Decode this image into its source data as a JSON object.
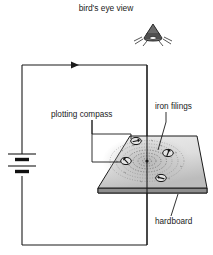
{
  "diagram": {
    "title_label": "bird's eye view",
    "labels": {
      "plotting_compass": "plotting compass",
      "iron_filings": "iron filings",
      "hardboard": "hardboard"
    },
    "icons": {
      "bird": "bird-icon",
      "battery": "battery-icon",
      "compass": "compass-icon",
      "current_arrow": "current-direction-arrow-icon"
    },
    "components": {
      "battery_cells": 2,
      "compass_count": 4,
      "filing_rings": 7,
      "current_direction": "right"
    },
    "colors": {
      "ink": "#1a1a1a",
      "board_fill_light": "#e9e9e9",
      "board_fill_dark": "#b9b9b9",
      "board_edge": "#8e8e8e",
      "filings": "#6f6f6f",
      "bird_body": "#6a6a6a"
    }
  }
}
